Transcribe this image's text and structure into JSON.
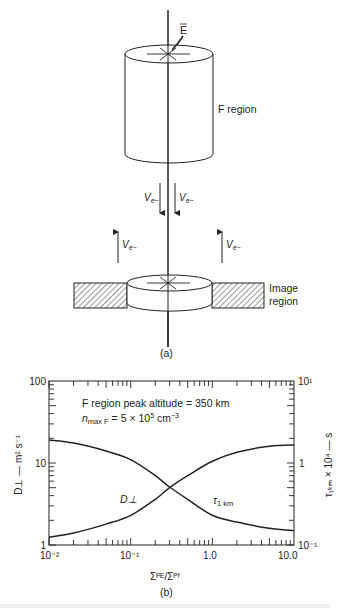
{
  "figure_a": {
    "label": "(a)",
    "field_label": "E",
    "f_region_label": "F region",
    "image_region_label_line1": "Image",
    "image_region_label_line2": "region",
    "velocity_label": "V",
    "velocity_sub": "e−",
    "arrows": [
      {
        "direction": "down",
        "position": "left-of-line"
      },
      {
        "direction": "down",
        "position": "right-of-line"
      },
      {
        "direction": "up",
        "position": "left"
      },
      {
        "direction": "up",
        "position": "right"
      }
    ]
  },
  "figure_b": {
    "label": "(b)",
    "annotation_line1": "F region peak altitude = 350 km",
    "annotation_line2_n": "n",
    "annotation_line2_sub": "max F",
    "annotation_line2_rest": " = 5 × 10",
    "annotation_line2_exp": "5",
    "annotation_line2_unit": " cm",
    "annotation_line2_unit_exp": "−3",
    "left_axis_label": "D⊥ — m² s⁻¹",
    "right_axis_label": "τ₁ₖₘ × 10⁴ — s",
    "x_axis_label": "Σᴾᴱ/Σᴾᶠ",
    "curve_label_d": "D⊥",
    "curve_label_tau": "τ",
    "curve_label_tau_sub": "1 km",
    "left_ticks": [
      "100",
      "10",
      "1"
    ],
    "right_ticks": [
      "10¹",
      "1",
      "10⁻¹"
    ],
    "x_ticks": [
      "10⁻²",
      "10⁻¹",
      "1.0",
      "10.0"
    ]
  },
  "chart_data": {
    "type": "line",
    "xlabel": "ΣP^E / ΣP^F",
    "ylabel": "D⊥ — m^2 s^-1",
    "y2label": "τ_1km × 10^4 — s",
    "xscale": "log",
    "yscale": "log",
    "xlim": [
      0.01,
      10.0
    ],
    "ylim": [
      1,
      100
    ],
    "y2lim": [
      0.1,
      10
    ],
    "legend": "inline labels",
    "series": [
      {
        "name": "D⊥",
        "axis": "left",
        "x": [
          0.01,
          0.02,
          0.05,
          0.1,
          0.2,
          0.3,
          0.5,
          1.0,
          2.0,
          5.0,
          10.0
        ],
        "values": [
          19,
          17.5,
          14,
          11,
          7,
          5.1,
          3.6,
          2.3,
          1.9,
          1.6,
          1.5
        ]
      },
      {
        "name": "τ 1km",
        "axis": "right",
        "x": [
          0.01,
          0.02,
          0.05,
          0.1,
          0.2,
          0.3,
          0.5,
          1.0,
          2.0,
          5.0,
          10.0
        ],
        "values": [
          0.125,
          0.14,
          0.18,
          0.23,
          0.36,
          0.5,
          0.7,
          1.05,
          1.35,
          1.6,
          1.66
        ]
      }
    ],
    "crossing": {
      "x": 0.3,
      "D": 5.0,
      "tau": 0.5
    }
  },
  "caption_partial": "Figure caption text (cut off)"
}
